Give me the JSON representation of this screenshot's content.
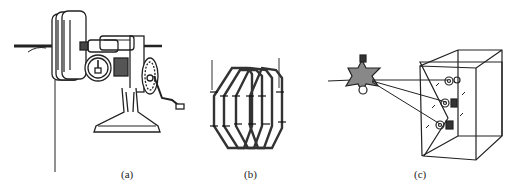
{
  "figure": {
    "panels": [
      {
        "id": "a",
        "caption": "(a)",
        "subject": "hand-crank coil winding machine with counter dial"
      },
      {
        "id": "b",
        "caption": "(b)",
        "subject": "interlaced hexagonal winding coils"
      },
      {
        "id": "c",
        "caption": "(c)",
        "subject": "wire guide star spool feeding terminals on a box"
      }
    ]
  },
  "colors": {
    "ink": "#222222",
    "background": "#ffffff"
  }
}
